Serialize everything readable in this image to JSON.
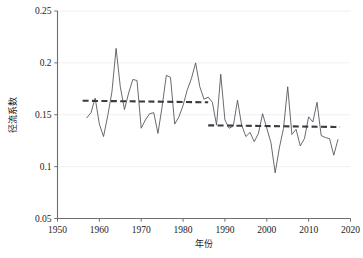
{
  "chart_data": {
    "type": "line",
    "title": "",
    "xlabel": "年份",
    "ylabel": "径流系数",
    "xlim": [
      1950,
      2020
    ],
    "ylim": [
      0.05,
      0.25
    ],
    "xticks": [
      1950,
      1960,
      1970,
      1980,
      1990,
      2000,
      2010,
      2020
    ],
    "xtick_labels": [
      "1950",
      "1960",
      "1970",
      "1980",
      "1990",
      "2000",
      "2010",
      "2020"
    ],
    "yticks": [
      0.05,
      0.1,
      0.15,
      0.2,
      0.25
    ],
    "ytick_labels": [
      "0.05",
      "0.1",
      "0.15",
      "0.2",
      "0.25"
    ],
    "grid": "horizontal",
    "legend": "none",
    "series": [
      {
        "name": "径流系数",
        "style": "solid",
        "color": "#4f4f55",
        "x": [
          1957,
          1958,
          1959,
          1960,
          1961,
          1962,
          1963,
          1964,
          1965,
          1966,
          1967,
          1968,
          1969,
          1970,
          1971,
          1972,
          1973,
          1974,
          1975,
          1976,
          1977,
          1978,
          1979,
          1980,
          1981,
          1982,
          1983,
          1984,
          1985,
          1986,
          1987,
          1988,
          1989,
          1990,
          1991,
          1992,
          1993,
          1994,
          1995,
          1996,
          1997,
          1998,
          1999,
          2000,
          2001,
          2002,
          2003,
          2004,
          2005,
          2006,
          2007,
          2008,
          2009,
          2010,
          2011,
          2012,
          2013,
          2014,
          2015,
          2016,
          2017
        ],
        "y": [
          0.147,
          0.152,
          0.166,
          0.141,
          0.129,
          0.149,
          0.172,
          0.214,
          0.177,
          0.155,
          0.171,
          0.184,
          0.183,
          0.137,
          0.145,
          0.151,
          0.152,
          0.132,
          0.158,
          0.188,
          0.186,
          0.141,
          0.148,
          0.159,
          0.174,
          0.185,
          0.2,
          0.177,
          0.165,
          0.167,
          0.162,
          0.14,
          0.189,
          0.145,
          0.137,
          0.139,
          0.164,
          0.14,
          0.129,
          0.133,
          0.124,
          0.132,
          0.151,
          0.137,
          0.123,
          0.094,
          0.118,
          0.137,
          0.177,
          0.131,
          0.136,
          0.12,
          0.127,
          0.148,
          0.143,
          0.162,
          0.13,
          0.128,
          0.127,
          0.111,
          0.126
        ]
      }
    ],
    "trend_segments": [
      {
        "name": "mean-1957-1986",
        "style": "dashed",
        "color": "#3a3a42",
        "x_start": 1956,
        "x_end": 1986,
        "y_start": 0.1635,
        "y_end": 0.162,
        "value": 0.163
      },
      {
        "name": "mean-1986-2017",
        "style": "dashed",
        "color": "#3a3a42",
        "x_start": 1986,
        "x_end": 2017.5,
        "y_start": 0.1398,
        "y_end": 0.1382,
        "value": 0.139
      }
    ]
  }
}
